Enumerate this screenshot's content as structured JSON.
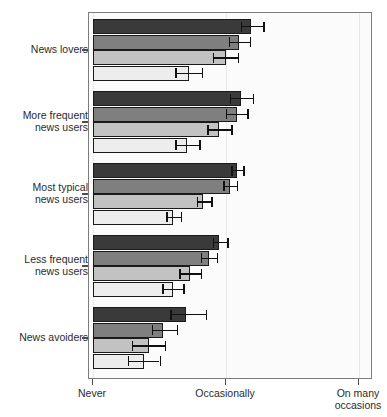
{
  "chart_data": {
    "type": "bar",
    "orientation": "horizontal",
    "title": "",
    "xlabel": "",
    "ylabel": "",
    "grid": true,
    "legend": "none",
    "xlim": [
      0,
      2
    ],
    "x_ticks": [
      {
        "value": 0,
        "label": "Never"
      },
      {
        "value": 1,
        "label": "Occasionally"
      },
      {
        "value": 2,
        "label": "On many\noccasions"
      }
    ],
    "categories": [
      "News lovers",
      "More frequent\nnews users",
      "Most typical\nnews users",
      "Less frequent\nnews users",
      "News avoiders"
    ],
    "series": [
      {
        "name": "series-1",
        "shade": "#3a3a3a",
        "values": [
          1.19,
          1.11,
          1.08,
          0.95,
          0.7
        ],
        "err_low": [
          1.11,
          1.03,
          1.04,
          0.9,
          0.58
        ],
        "err_high": [
          1.28,
          1.2,
          1.13,
          1.01,
          0.85
        ]
      },
      {
        "name": "series-2",
        "shade": "#7f7f7f",
        "values": [
          1.1,
          1.08,
          1.03,
          0.87,
          0.53
        ],
        "err_low": [
          1.02,
          1.0,
          0.98,
          0.81,
          0.44
        ],
        "err_high": [
          1.18,
          1.16,
          1.08,
          0.93,
          0.63
        ]
      },
      {
        "name": "series-3",
        "shade": "#c2c2c2",
        "values": [
          1.0,
          0.95,
          0.83,
          0.73,
          0.42
        ],
        "err_low": [
          0.9,
          0.86,
          0.78,
          0.65,
          0.29
        ],
        "err_high": [
          1.09,
          1.04,
          0.89,
          0.81,
          0.54
        ]
      },
      {
        "name": "series-4",
        "shade": "#ededed",
        "values": [
          0.72,
          0.71,
          0.6,
          0.6,
          0.38
        ],
        "err_low": [
          0.62,
          0.62,
          0.55,
          0.52,
          0.26
        ],
        "err_high": [
          0.82,
          0.8,
          0.66,
          0.68,
          0.5
        ]
      }
    ]
  }
}
